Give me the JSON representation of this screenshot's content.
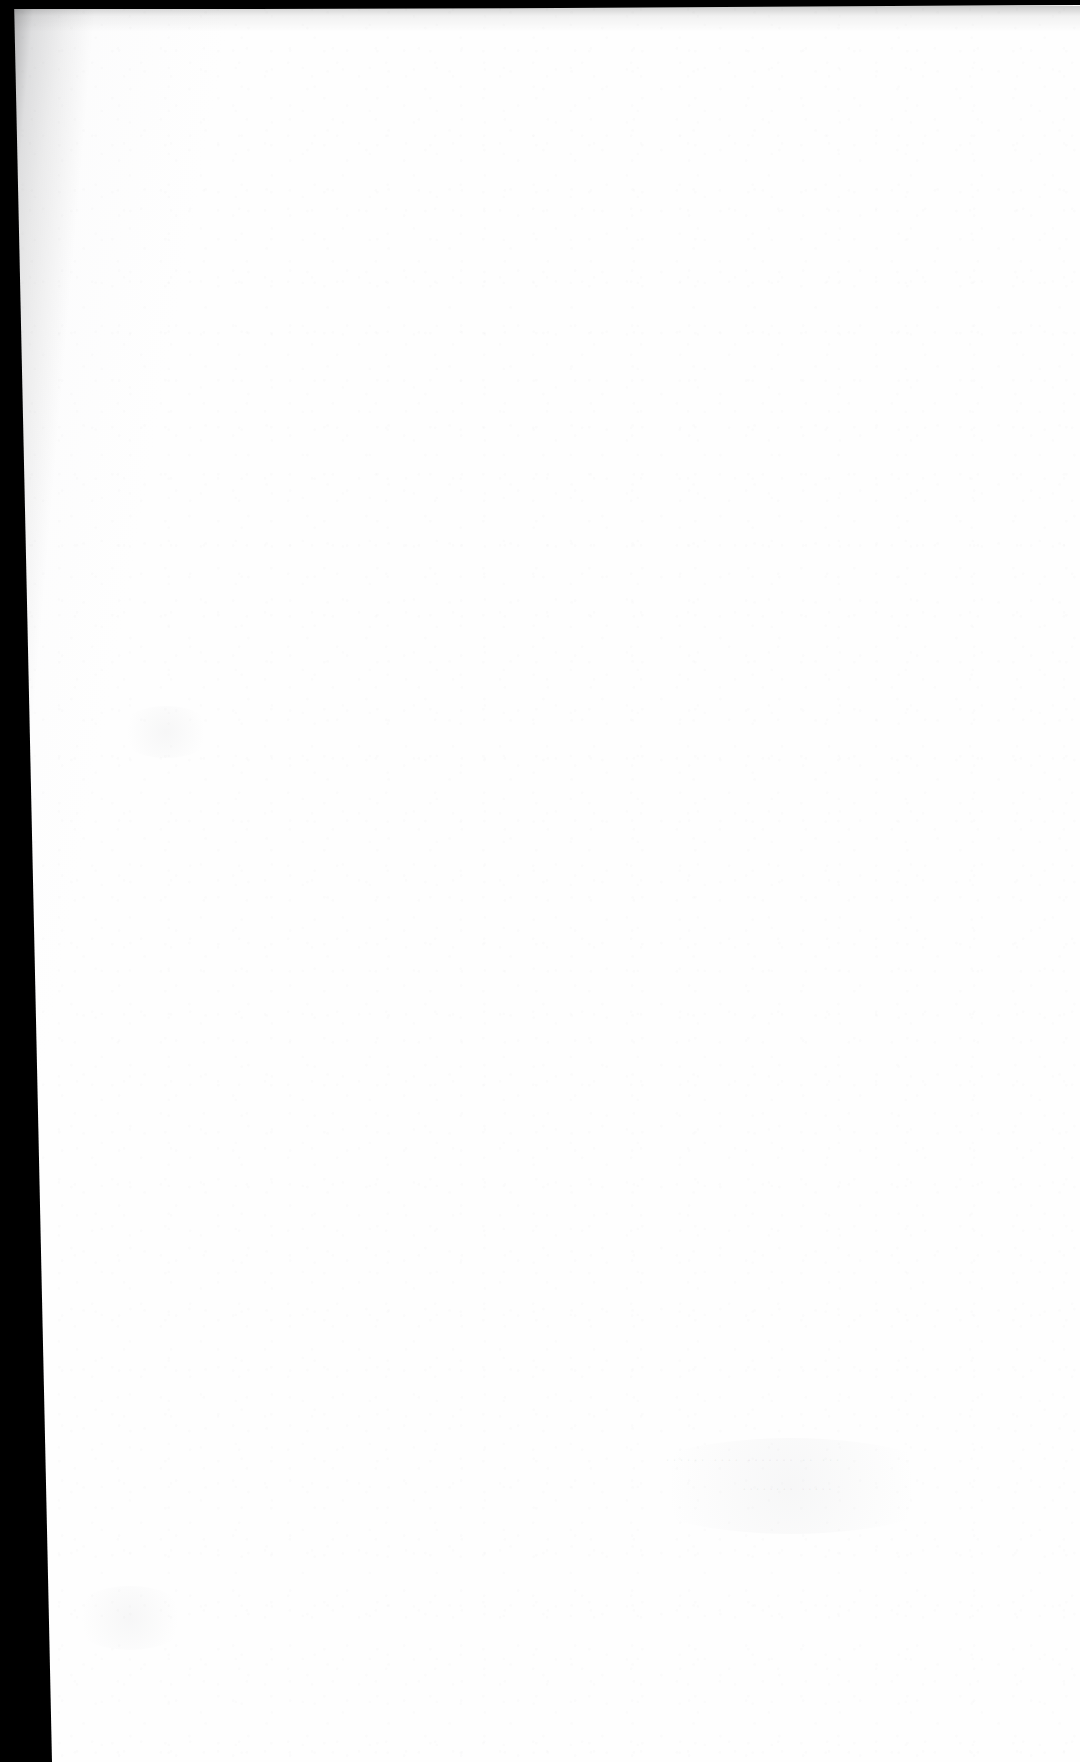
{
  "document": {
    "kind": "scanned-book-page",
    "page_state": "blank",
    "visible_text": "",
    "background_color": "#fefefe",
    "page_width": 1080,
    "page_height": 1762
  },
  "artifacts": {
    "gutter_band": {
      "name": "left-gutter-shadow",
      "color": "#000000",
      "edge": "left",
      "width_top_px": 2,
      "width_bottom_px": 50
    },
    "top_edge_strip": {
      "name": "top-edge-shadow",
      "color": "#000000",
      "edge": "top",
      "height_px": 9
    },
    "ghost_text": {
      "description": "faint bleed-through from the reverse side, illegible",
      "line_1": "······ ···· ······· ·· ···",
      "line_2": "········ ·····"
    },
    "grain": {
      "description": "fine paper speckle across the whole sheet",
      "tone": "#8c8c96"
    }
  }
}
